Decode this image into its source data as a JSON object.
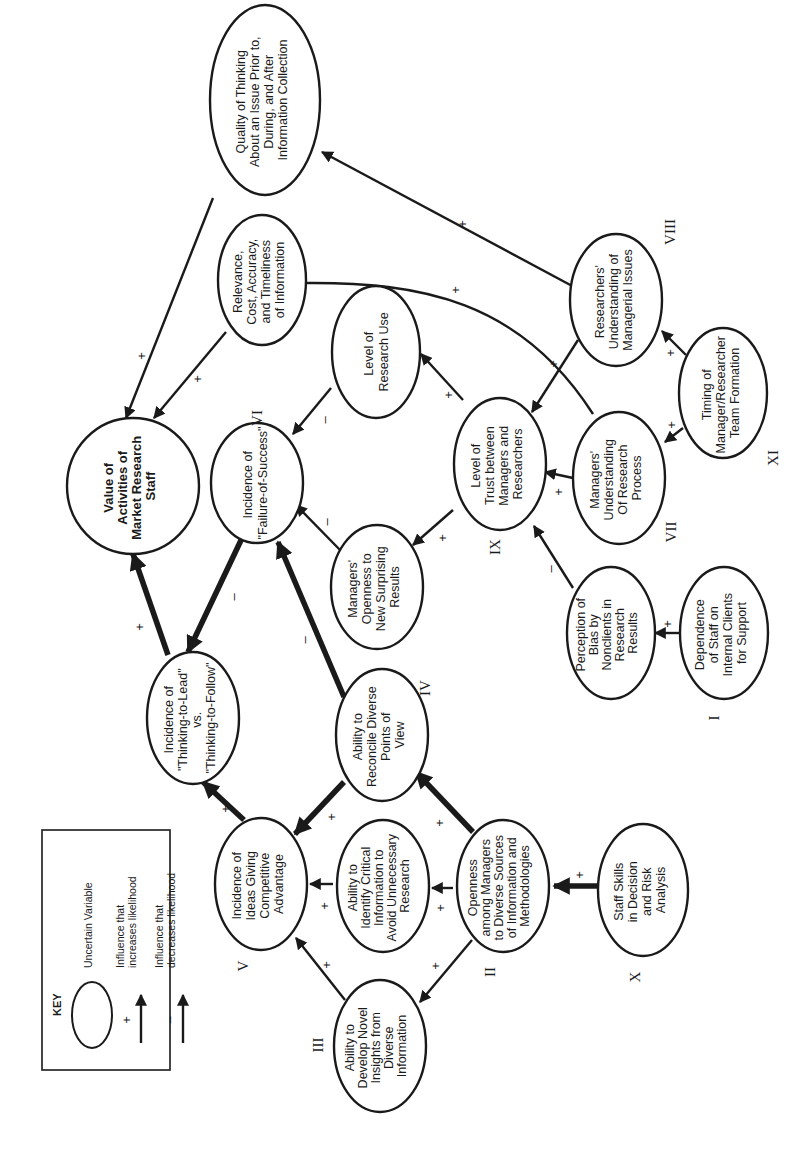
{
  "diagram": {
    "orientation": "rotated-90-ccw",
    "key": {
      "title": "KEY",
      "items": [
        {
          "symbol": "ellipse",
          "sign": "",
          "label": "Uncertain Variable"
        },
        {
          "symbol": "arrow",
          "sign": "+",
          "label_line1": "Influence that",
          "label_line2": "increases likelihood"
        },
        {
          "symbol": "arrow",
          "sign": "–",
          "label_line1": "Influence that",
          "label_line2": "decreases likelihood"
        }
      ]
    },
    "nodes": [
      {
        "id": "value",
        "lines": [
          "Value of",
          "Activities of",
          "Market Research",
          "Staff"
        ],
        "bold": true,
        "numeral": ""
      },
      {
        "id": "quality",
        "lines": [
          "Quality of Thinking",
          "About an Issue Prior to,",
          "During, and After",
          "Information Collection"
        ],
        "numeral": ""
      },
      {
        "id": "relevance",
        "lines": [
          "Relevance,",
          "Cost, Accuracy,",
          "and Timeliness",
          "of Information"
        ],
        "numeral": ""
      },
      {
        "id": "failure",
        "lines": [
          "Incidence of",
          "\"Failure-of-Success\""
        ],
        "numeral": "VI"
      },
      {
        "id": "research_use",
        "lines": [
          "Level of",
          "Research Use"
        ],
        "numeral": ""
      },
      {
        "id": "researchers_understanding",
        "lines": [
          "Researchers'",
          "Understanding of",
          "Managerial Issues"
        ],
        "numeral": "VIII"
      },
      {
        "id": "thinking_lead",
        "lines": [
          "Incidence of",
          "\"Thinking-to-Lead\"",
          "vs.",
          "\"Thinking-to-Follow\""
        ],
        "numeral": ""
      },
      {
        "id": "managers_openness",
        "lines": [
          "Managers'",
          "Openness to",
          "New Surprising",
          "Results"
        ],
        "numeral": ""
      },
      {
        "id": "trust",
        "lines": [
          "Level of",
          "Trust between",
          "Managers and",
          "Researchers"
        ],
        "numeral": "IX"
      },
      {
        "id": "managers_understanding",
        "lines": [
          "Managers'",
          "Understanding",
          "Of Research",
          "Process"
        ],
        "numeral": "VII"
      },
      {
        "id": "timing",
        "lines": [
          "Timing of",
          "Manager/Researcher",
          "Team Formation"
        ],
        "numeral": "XI"
      },
      {
        "id": "reconcile",
        "lines": [
          "Ability to",
          "Reconcile Diverse",
          "Points of",
          "View"
        ],
        "numeral": "IV"
      },
      {
        "id": "perception_bias",
        "lines": [
          "Perception of",
          "Bias by",
          "Nonclients in",
          "Research",
          "Results"
        ],
        "numeral": ""
      },
      {
        "id": "dependence",
        "lines": [
          "Dependence",
          "of Staff on",
          "Internal Clients",
          "for Support"
        ],
        "numeral": "I"
      },
      {
        "id": "ideas",
        "lines": [
          "Incidence of",
          "Ideas Giving",
          "Competitive",
          "Advantage"
        ],
        "numeral": "V"
      },
      {
        "id": "identify_critical",
        "lines": [
          "Ability to",
          "Identify Critical",
          "Information to",
          "Avoid Unnecessary",
          "Research"
        ],
        "numeral": ""
      },
      {
        "id": "openness_sources",
        "lines": [
          "Openness",
          "among Managers",
          "to Diverse Sources",
          "of Information and",
          "Methodologies"
        ],
        "numeral": "II"
      },
      {
        "id": "staff_skills",
        "lines": [
          "Staff Skills",
          "in Decision",
          "and Risk",
          "Analysis"
        ],
        "numeral": "X"
      },
      {
        "id": "novel_insights",
        "lines": [
          "Ability to",
          "Develop Novel",
          "Insights from",
          "Diverse",
          "Information"
        ],
        "numeral": "III"
      }
    ],
    "edges": [
      {
        "from": "quality",
        "to": "value",
        "sign": "+",
        "weight": "thin"
      },
      {
        "from": "relevance",
        "to": "value",
        "sign": "+",
        "weight": "thin"
      },
      {
        "from": "thinking_lead",
        "to": "value",
        "sign": "+",
        "weight": "thick"
      },
      {
        "from": "failure",
        "to": "thinking_lead",
        "sign": "–",
        "weight": "thick"
      },
      {
        "from": "research_use",
        "to": "failure",
        "sign": "–",
        "weight": "thin"
      },
      {
        "from": "managers_openness",
        "to": "failure",
        "sign": "–",
        "weight": "thin"
      },
      {
        "from": "reconcile",
        "to": "failure",
        "sign": "–",
        "weight": "thick"
      },
      {
        "from": "researchers_understanding",
        "to": "quality",
        "sign": "+",
        "weight": "thin"
      },
      {
        "from": "managers_understanding",
        "to": "relevance",
        "sign": "+",
        "weight": "thin"
      },
      {
        "from": "trust",
        "to": "research_use",
        "sign": "+",
        "weight": "thin"
      },
      {
        "from": "trust",
        "to": "managers_openness",
        "sign": "+",
        "weight": "thin"
      },
      {
        "from": "researchers_understanding",
        "to": "trust",
        "sign": "+",
        "weight": "thin"
      },
      {
        "from": "managers_understanding",
        "to": "trust",
        "sign": "+",
        "weight": "thin"
      },
      {
        "from": "perception_bias",
        "to": "trust",
        "sign": "–",
        "weight": "thin"
      },
      {
        "from": "timing",
        "to": "researchers_understanding",
        "sign": "+",
        "weight": "thin"
      },
      {
        "from": "timing",
        "to": "managers_understanding",
        "sign": "+",
        "weight": "thin"
      },
      {
        "from": "dependence",
        "to": "perception_bias",
        "sign": "+",
        "weight": "thin"
      },
      {
        "from": "ideas",
        "to": "thinking_lead",
        "sign": "+",
        "weight": "thick"
      },
      {
        "from": "reconcile",
        "to": "ideas",
        "sign": "+",
        "weight": "thick"
      },
      {
        "from": "identify_critical",
        "to": "ideas",
        "sign": "+",
        "weight": "thin"
      },
      {
        "from": "novel_insights",
        "to": "ideas",
        "sign": "+",
        "weight": "thin"
      },
      {
        "from": "openness_sources",
        "to": "reconcile",
        "sign": "+",
        "weight": "thick"
      },
      {
        "from": "openness_sources",
        "to": "identify_critical",
        "sign": "+",
        "weight": "thin"
      },
      {
        "from": "openness_sources",
        "to": "novel_insights",
        "sign": "+",
        "weight": "thin"
      },
      {
        "from": "staff_skills",
        "to": "openness_sources",
        "sign": "+",
        "weight": "thick"
      }
    ]
  }
}
